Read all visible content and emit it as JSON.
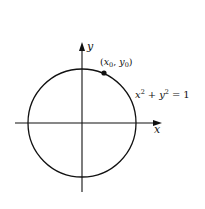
{
  "diagram": {
    "type": "unit-circle",
    "stroke_color": "#111111",
    "background": "#ffffff",
    "center": {
      "x": 82,
      "y": 123
    },
    "radius": 54,
    "axes": {
      "x_label": "x",
      "y_label": "y"
    },
    "point": {
      "label_x": "x",
      "label_x_sub": "0",
      "label_y": "y",
      "label_y_sub": "0",
      "open_paren": "(",
      "comma": ",",
      "close_paren": ")"
    },
    "equation": {
      "x": "x",
      "x_exp": "2",
      "plus": "+",
      "y": "y",
      "y_exp": "2",
      "equals": "=",
      "rhs": "1"
    }
  }
}
